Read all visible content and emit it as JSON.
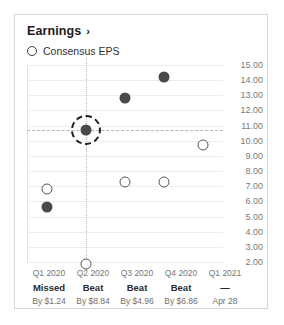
{
  "card": {
    "title": "Earnings",
    "title_chevron": "›",
    "legend": {
      "label": "Consensus EPS",
      "marker": "hollow-circle"
    }
  },
  "chart_data": {
    "type": "scatter",
    "title": "Earnings",
    "xlabel": "",
    "ylabel": "",
    "ylim": [
      2.0,
      15.0
    ],
    "grid": true,
    "legend_position": "top-left",
    "categories": [
      "Q1 2020",
      "Q2 2020",
      "Q3 2020",
      "Q4 2020",
      "Q1 2021"
    ],
    "yticks": [
      "15.00",
      "14.00",
      "13.00",
      "12.00",
      "11.00",
      "10.00",
      "9.00",
      "8.00",
      "7.00",
      "6.00",
      "5.00",
      "4.00",
      "3.00",
      "2.00"
    ],
    "series": [
      {
        "name": "Actual EPS",
        "marker": "filled-circle",
        "values": [
          5.6,
          10.7,
          12.8,
          14.2,
          null
        ]
      },
      {
        "name": "Consensus EPS",
        "marker": "hollow-circle",
        "values": [
          6.8,
          1.9,
          7.3,
          7.3,
          9.7
        ]
      }
    ],
    "selected": {
      "category": "Q2 2020",
      "series": "Actual EPS",
      "value": 10.7
    },
    "annotations": [
      {
        "category": "Q1 2020",
        "result": "Missed",
        "amount": "By $1.24"
      },
      {
        "category": "Q2 2020",
        "result": "Beat",
        "amount": "By $8.84"
      },
      {
        "category": "Q3 2020",
        "result": "Beat",
        "amount": "By $4.96"
      },
      {
        "category": "Q4 2020",
        "result": "Beat",
        "amount": "By $6.86"
      },
      {
        "category": "Q1 2021",
        "result": "—",
        "amount": "Apr 28"
      }
    ]
  },
  "colors": {
    "actual": "#4a4a4a",
    "consensus_stroke": "#555555",
    "grid": "#ededed",
    "crosshair": "#b5b5b5",
    "selection_ring": "#1f1f1f",
    "border": "#d8d8d8"
  }
}
